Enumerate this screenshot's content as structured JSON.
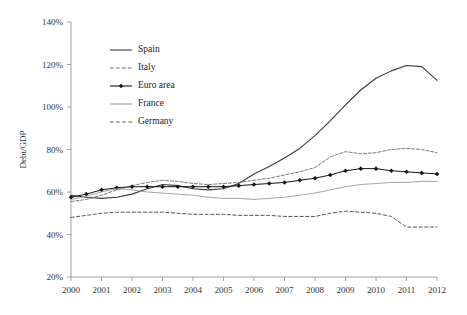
{
  "chart_data": {
    "type": "line",
    "title": "",
    "xlabel": "",
    "ylabel": "Debt/GDP",
    "xlim": [
      2000,
      2012
    ],
    "ylim": [
      20,
      140
    ],
    "y_tick_labels": [
      "140%",
      "120%",
      "100%",
      "80%",
      "60%",
      "40%",
      "20%"
    ],
    "y_tick_values": [
      140,
      120,
      100,
      80,
      60,
      40,
      20
    ],
    "x_tick_labels": [
      "2000",
      "2001",
      "2002",
      "2003",
      "2004",
      "2005",
      "2006",
      "2007",
      "2008",
      "2009",
      "2010",
      "2011",
      "2012"
    ],
    "x": [
      2000,
      2000.5,
      2001,
      2001.5,
      2002,
      2002.5,
      2003,
      2003.5,
      2004,
      2004.5,
      2005,
      2005.5,
      2006,
      2006.5,
      2007,
      2007.5,
      2008,
      2008.5,
      2009,
      2009.5,
      2010,
      2010.5,
      2011,
      2011.5,
      2012
    ],
    "grid": false,
    "legend_position": "upper-left-inside",
    "series": [
      {
        "name": "Spain",
        "style": "solid",
        "color": "#3a3a3a",
        "width": 1.1,
        "marker": "none",
        "values": [
          58.5,
          57.5,
          57.0,
          57.5,
          59.0,
          61.5,
          63.5,
          63.0,
          61.5,
          61.0,
          61.5,
          64.0,
          68.5,
          72.0,
          76.0,
          80.5,
          86.5,
          93.5,
          101.0,
          108.0,
          113.5,
          117.0,
          119.5,
          119.0,
          112.5
        ]
      },
      {
        "name": "Italy",
        "style": "dash-dot",
        "color": "#6b6b6b",
        "width": 0.9,
        "marker": "none",
        "values": [
          55.5,
          56.5,
          58.5,
          61.0,
          63.0,
          64.5,
          65.5,
          65.0,
          64.0,
          63.5,
          64.0,
          64.5,
          65.5,
          66.5,
          68.0,
          69.5,
          71.5,
          76.5,
          79.0,
          78.0,
          78.5,
          80.0,
          80.5,
          80.0,
          78.5
        ]
      },
      {
        "name": "Euro area",
        "style": "solid",
        "color": "#141414",
        "width": 1.0,
        "marker": "diamond",
        "values": [
          57.5,
          59.0,
          61.0,
          62.0,
          62.5,
          62.5,
          62.5,
          62.5,
          62.5,
          62.5,
          62.5,
          63.0,
          63.5,
          64.0,
          64.5,
          65.5,
          66.5,
          68.0,
          70.0,
          71.0,
          71.0,
          70.0,
          69.5,
          69.0,
          68.5
        ]
      },
      {
        "name": "France",
        "style": "solid",
        "color": "#9a9a9a",
        "width": 0.9,
        "marker": "none",
        "values": [
          56.5,
          58.0,
          60.0,
          61.5,
          61.0,
          60.0,
          59.5,
          59.0,
          58.5,
          57.5,
          57.0,
          57.0,
          56.5,
          57.0,
          57.5,
          58.5,
          59.5,
          61.0,
          62.5,
          63.5,
          64.0,
          64.5,
          64.5,
          65.0,
          65.0
        ]
      },
      {
        "name": "Germany",
        "style": "dashed",
        "color": "#555555",
        "width": 1.0,
        "marker": "none",
        "values": [
          48.0,
          49.0,
          50.0,
          50.5,
          50.5,
          50.5,
          50.5,
          50.0,
          49.5,
          49.5,
          49.5,
          49.0,
          49.0,
          49.0,
          48.5,
          48.5,
          48.5,
          50.0,
          51.0,
          50.5,
          50.0,
          48.5,
          43.5,
          43.5,
          43.5
        ]
      }
    ],
    "legend": [
      {
        "label": "Spain",
        "style": "solid",
        "color": "#3a3a3a",
        "marker": "none"
      },
      {
        "label": "Italy",
        "style": "dash-dot",
        "color": "#6b6b6b",
        "marker": "none"
      },
      {
        "label": "Euro area",
        "style": "solid",
        "color": "#141414",
        "marker": "diamond"
      },
      {
        "label": "France",
        "style": "solid",
        "color": "#9a9a9a",
        "marker": "none"
      },
      {
        "label": "Germany",
        "style": "dashed",
        "color": "#555555",
        "marker": "none"
      }
    ]
  }
}
